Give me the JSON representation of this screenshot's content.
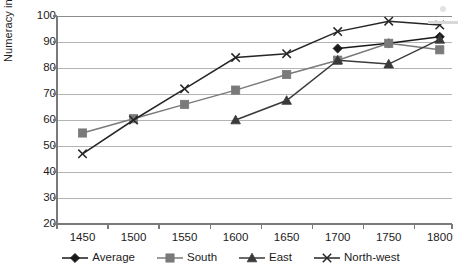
{
  "chart_data": {
    "type": "line",
    "title": "",
    "xlabel": "",
    "ylabel": "Numeracy in %",
    "x": [
      1450,
      1500,
      1550,
      1600,
      1650,
      1700,
      1750,
      1800
    ],
    "xticklabels": [
      "1450",
      "1500",
      "1550",
      "1600",
      "1650",
      "1700",
      "1750",
      "1800"
    ],
    "yticklabels": [
      "20",
      "30",
      "40",
      "50",
      "60",
      "70",
      "80",
      "90",
      "100"
    ],
    "yticks": [
      20,
      30,
      40,
      50,
      60,
      70,
      80,
      90,
      100
    ],
    "xlim": [
      1425,
      1812
    ],
    "ylim": [
      20,
      100
    ],
    "grid": "horizontal",
    "legend_position": "bottom",
    "series": [
      {
        "name": "Average",
        "marker": "diamond",
        "color": "#1a1a1a",
        "x": [
          1700,
          1750,
          1800
        ],
        "values": [
          87.5,
          89.5,
          92
        ]
      },
      {
        "name": "South",
        "marker": "square",
        "color": "#7a7a7a",
        "x": [
          1450,
          1500,
          1550,
          1600,
          1650,
          1700,
          1750,
          1800
        ],
        "values": [
          55,
          60.5,
          66,
          71.5,
          77.5,
          83,
          89.5,
          87
        ]
      },
      {
        "name": "East",
        "marker": "triangle",
        "color": "#3a3a3a",
        "x": [
          1600,
          1650,
          1700,
          1750,
          1800
        ],
        "values": [
          60,
          67.5,
          83,
          81.5,
          91
        ]
      },
      {
        "name": "North-west",
        "marker": "cross",
        "color": "#262626",
        "x": [
          1450,
          1500,
          1550,
          1600,
          1650,
          1700,
          1750,
          1800
        ],
        "values": [
          47,
          60,
          72,
          84,
          85.5,
          94,
          98,
          96.5
        ]
      }
    ]
  },
  "legend": {
    "items": [
      {
        "label": "Average"
      },
      {
        "label": "South"
      },
      {
        "label": "East"
      },
      {
        "label": "North-west"
      }
    ]
  },
  "axes": {
    "y_title": "Numeracy in %"
  }
}
